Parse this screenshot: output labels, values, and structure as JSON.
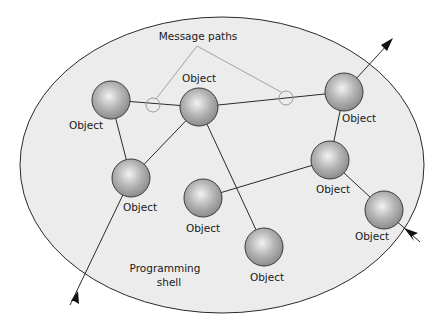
{
  "diagram": {
    "shell": {
      "label_line1": "Programming",
      "label_line2": "shell",
      "fill": "#ececec",
      "stroke": "#2a2a2a"
    },
    "message_paths_label": "Message paths",
    "nodes": [
      {
        "id": "n1",
        "label": "Object"
      },
      {
        "id": "n2",
        "label": "Object"
      },
      {
        "id": "n3",
        "label": "Object"
      },
      {
        "id": "n4",
        "label": "Object"
      },
      {
        "id": "n5",
        "label": "Object"
      },
      {
        "id": "n6",
        "label": "Object"
      },
      {
        "id": "n7",
        "label": "Object"
      },
      {
        "id": "n8",
        "label": "Object"
      }
    ],
    "edges": [
      [
        "n1",
        "n2"
      ],
      [
        "n1",
        "n4"
      ],
      [
        "n2",
        "n4"
      ],
      [
        "n2",
        "n7"
      ],
      [
        "n2",
        "n3"
      ],
      [
        "n3",
        "n5"
      ],
      [
        "n5",
        "n6"
      ],
      [
        "n5",
        "n8"
      ]
    ],
    "external_arrows": [
      {
        "from": "n3",
        "direction": "outgoing"
      },
      {
        "to": "n4",
        "direction": "incoming"
      },
      {
        "to": "n8",
        "direction": "incoming"
      }
    ],
    "colors": {
      "node_fill_center": "#e6e6e6",
      "node_fill_edge": "#8a8a8a",
      "edge": "#2a2a2a",
      "message_path": "#9a9a9a"
    }
  }
}
